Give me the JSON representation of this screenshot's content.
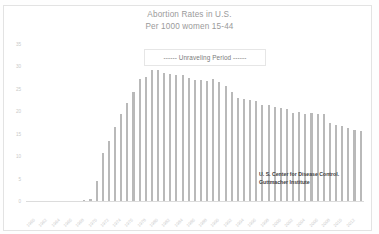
{
  "chart_data": {
    "type": "bar",
    "title": "Abortion Rates in U.S.",
    "subtitle": "Per 1000 women 15-44",
    "xlabel": "",
    "ylabel": "",
    "ylim": [
      0,
      35
    ],
    "ytick_labels": [
      "35",
      "30",
      "25",
      "20",
      "15",
      "10",
      "5",
      "0"
    ],
    "ytick_values": [
      35,
      30,
      25,
      20,
      15,
      10,
      5,
      0
    ],
    "grid": false,
    "legend_position": "inside-top-center",
    "bar_color": "#b9b9b9",
    "annotation": "------ Unraveling Period ------",
    "source_lines": [
      "U. S. Center for Disease Control.",
      "Guttmacher Institute"
    ],
    "categories": [
      "1960",
      "1961",
      "1962",
      "1963",
      "1964",
      "1965",
      "1966",
      "1967",
      "1968",
      "1969",
      "1970",
      "1971",
      "1972",
      "1973",
      "1974",
      "1975",
      "1976",
      "1977",
      "1978",
      "1979",
      "1980",
      "1981",
      "1982",
      "1983",
      "1984",
      "1985",
      "1986",
      "1987",
      "1988",
      "1989",
      "1990",
      "1991",
      "1992",
      "1993",
      "1994",
      "1995",
      "1996",
      "1997",
      "1998",
      "1999",
      "2000",
      "2001",
      "2002",
      "2003",
      "2004",
      "2005",
      "2006",
      "2007",
      "2008",
      "2009",
      "2010",
      "2011",
      "2012",
      "2013",
      "2014"
    ],
    "xtick_labels": [
      "1960",
      "1962",
      "1964",
      "1966",
      "1968",
      "1970",
      "1972",
      "1974",
      "1976",
      "1978",
      "1980",
      "1982",
      "1984",
      "1986",
      "1988",
      "1990",
      "1992",
      "1994",
      "1996",
      "1998",
      "2000",
      "2002",
      "2004",
      "2006",
      "2008",
      "2010",
      "2012"
    ],
    "values": [
      0,
      0,
      0,
      0,
      0,
      0,
      0,
      0,
      0,
      0.3,
      0.5,
      4.4,
      10.7,
      13.3,
      16.5,
      19.3,
      21.8,
      24.3,
      27.1,
      27.7,
      29.3,
      29.1,
      28.6,
      28.4,
      28.1,
      28.0,
      27.4,
      26.9,
      27.0,
      26.8,
      27.2,
      26.6,
      25.7,
      24.3,
      23.0,
      22.7,
      22.5,
      22.2,
      21.4,
      21.3,
      21.0,
      20.8,
      20.5,
      19.7,
      19.8,
      19.4,
      19.7,
      19.5,
      19.4,
      17.4,
      17.0,
      16.8,
      16.3,
      15.9,
      15.5
    ]
  }
}
